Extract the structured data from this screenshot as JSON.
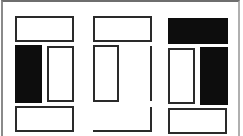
{
  "diagram": {
    "colors": {
      "stroke": "#2a2a2a",
      "fill_dark": "#0d0d0d",
      "background": "#ffffff",
      "frame": "#8a8a8a"
    },
    "panels": [
      {
        "name": "left",
        "shapes": [
          {
            "id": "top",
            "type": "outline",
            "x": 15,
            "y": 16,
            "w": 59,
            "h": 26
          },
          {
            "id": "mid-left",
            "type": "filled",
            "x": 15,
            "y": 45,
            "w": 27,
            "h": 58
          },
          {
            "id": "mid-right",
            "type": "outline",
            "x": 47,
            "y": 46,
            "w": 27,
            "h": 56
          },
          {
            "id": "bottom",
            "type": "outline",
            "x": 15,
            "y": 106,
            "w": 59,
            "h": 26
          }
        ]
      },
      {
        "name": "middle",
        "shapes": [
          {
            "id": "top",
            "type": "outline",
            "x": 93,
            "y": 16,
            "w": 59,
            "h": 26
          },
          {
            "id": "mid-left",
            "type": "outline",
            "x": 93,
            "y": 45,
            "w": 26,
            "h": 57
          },
          {
            "id": "right-line-upper",
            "type": "vline",
            "x": 150,
            "y": 46,
            "h": 55
          },
          {
            "id": "right-line-lower",
            "type": "vline",
            "x": 150,
            "y": 107,
            "h": 25
          },
          {
            "id": "bottom-line",
            "type": "hline",
            "x": 93,
            "y": 130,
            "w": 59
          }
        ]
      },
      {
        "name": "right",
        "shapes": [
          {
            "id": "top",
            "type": "filled",
            "x": 168,
            "y": 18,
            "w": 60,
            "h": 26
          },
          {
            "id": "mid-left",
            "type": "outline",
            "x": 168,
            "y": 48,
            "w": 27,
            "h": 56
          },
          {
            "id": "mid-right",
            "type": "filled",
            "x": 200,
            "y": 47,
            "w": 28,
            "h": 58
          },
          {
            "id": "bottom",
            "type": "outline",
            "x": 168,
            "y": 108,
            "w": 59,
            "h": 26
          }
        ]
      }
    ]
  }
}
